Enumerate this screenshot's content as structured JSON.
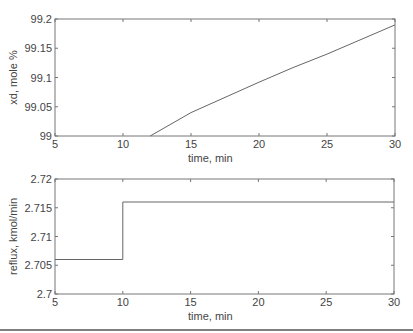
{
  "chart_data": [
    {
      "type": "line",
      "title": "",
      "xlabel": "time, min",
      "ylabel": "xd, mole %",
      "xlim": [
        5,
        30
      ],
      "ylim": [
        99,
        99.2
      ],
      "xticks": [
        "5",
        "10",
        "15",
        "20",
        "25",
        "30"
      ],
      "yticks": [
        "99",
        "99.05",
        "99.1",
        "99.15",
        "99.2"
      ],
      "grid": false,
      "legend": null,
      "series": [
        {
          "name": "xd",
          "x": [
            12,
            15,
            17.5,
            20,
            22.5,
            25,
            27.5,
            30
          ],
          "y": [
            99.0,
            99.04,
            99.066,
            99.092,
            99.117,
            99.14,
            99.165,
            99.19
          ]
        }
      ]
    },
    {
      "type": "line",
      "title": "",
      "xlabel": "time, min",
      "ylabel": "reflux, kmol/min",
      "xlim": [
        5,
        30
      ],
      "ylim": [
        2.7,
        2.72
      ],
      "xticks": [
        "5",
        "10",
        "15",
        "20",
        "25",
        "30"
      ],
      "yticks": [
        "2.7",
        "2.705",
        "2.71",
        "2.715",
        "2.72"
      ],
      "grid": false,
      "legend": null,
      "series": [
        {
          "name": "reflux",
          "step": true,
          "x": [
            5,
            10,
            10,
            30
          ],
          "y": [
            2.706,
            2.706,
            2.716,
            2.716
          ]
        }
      ]
    }
  ]
}
